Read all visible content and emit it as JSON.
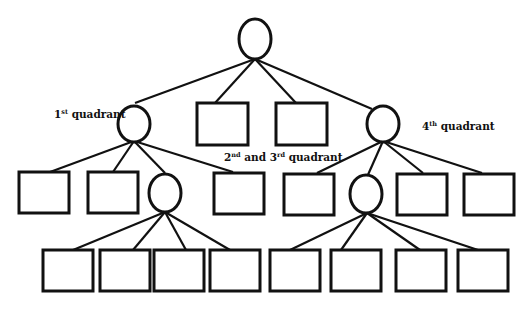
{
  "diagram": {
    "type": "tree",
    "labels": {
      "q1": {
        "num": "1",
        "sup": "st",
        "text": " quadrant"
      },
      "q23": {
        "num1": "2",
        "sup1": "nd",
        "mid": " and 3",
        "sup2": "rd",
        "text": " quadrant"
      },
      "q4": {
        "num": "4",
        "sup": "th",
        "text": " quadrant"
      }
    },
    "nodes": [
      {
        "id": "root",
        "shape": "circle",
        "level": 0
      },
      {
        "id": "q1",
        "shape": "circle",
        "level": 1,
        "parent": "root"
      },
      {
        "id": "r1",
        "shape": "rect",
        "level": 1,
        "parent": "root"
      },
      {
        "id": "r2",
        "shape": "rect",
        "level": 1,
        "parent": "root"
      },
      {
        "id": "q4",
        "shape": "circle",
        "level": 1,
        "parent": "root"
      },
      {
        "id": "a1",
        "shape": "rect",
        "level": 2,
        "parent": "q1"
      },
      {
        "id": "a2",
        "shape": "rect",
        "level": 2,
        "parent": "q1"
      },
      {
        "id": "a3",
        "shape": "circle",
        "level": 2,
        "parent": "q1"
      },
      {
        "id": "a4",
        "shape": "rect",
        "level": 2,
        "parent": "q1"
      },
      {
        "id": "b1",
        "shape": "rect",
        "level": 2,
        "parent": "q4"
      },
      {
        "id": "b2",
        "shape": "circle",
        "level": 2,
        "parent": "q4"
      },
      {
        "id": "b3",
        "shape": "rect",
        "level": 2,
        "parent": "q4"
      },
      {
        "id": "b4",
        "shape": "rect",
        "level": 2,
        "parent": "q4"
      },
      {
        "id": "c1",
        "shape": "rect",
        "level": 3,
        "parent": "a3"
      },
      {
        "id": "c2",
        "shape": "rect",
        "level": 3,
        "parent": "a3"
      },
      {
        "id": "c3",
        "shape": "rect",
        "level": 3,
        "parent": "a3"
      },
      {
        "id": "c4",
        "shape": "rect",
        "level": 3,
        "parent": "a3"
      },
      {
        "id": "d1",
        "shape": "rect",
        "level": 3,
        "parent": "b2"
      },
      {
        "id": "d2",
        "shape": "rect",
        "level": 3,
        "parent": "b2"
      },
      {
        "id": "d3",
        "shape": "rect",
        "level": 3,
        "parent": "b2"
      },
      {
        "id": "d4",
        "shape": "rect",
        "level": 3,
        "parent": "b2"
      }
    ],
    "colors": {
      "stroke": "#111111",
      "background": "#ffffff"
    }
  }
}
